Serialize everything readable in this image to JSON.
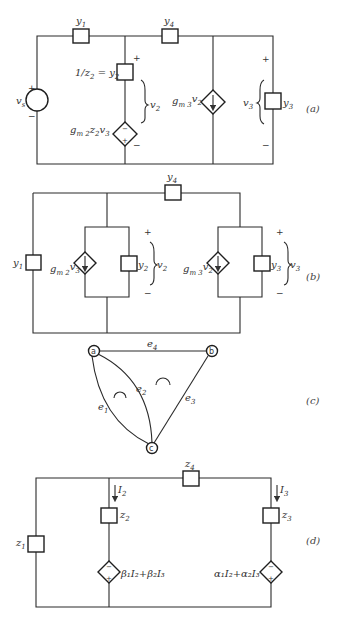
{
  "figure": {
    "panels": [
      {
        "id": "a",
        "tag": "(a)",
        "elements": {
          "source": {
            "label": "v",
            "sub": "s",
            "plus": "+",
            "minus": "−"
          },
          "y1": {
            "label": "y",
            "sub": "1"
          },
          "y4": {
            "label": "y",
            "sub": "4"
          },
          "y2": {
            "label": "1/z",
            "sub": "2",
            "suffix": " = y",
            "suffix_sub": "2",
            "plus": "+"
          },
          "dep2": {
            "label": "g",
            "sub": "m 2",
            "rest": "z",
            "rest_sub": "2",
            "tail": "v",
            "tail_sub": "3",
            "minus": "−"
          },
          "v2": {
            "label": "v",
            "sub": "2"
          },
          "dep3": {
            "label": "g",
            "sub": "m 3",
            "tail": "v",
            "tail_sub": "2"
          },
          "y3": {
            "label": "y",
            "sub": "3",
            "v": "v",
            "v_sub": "3",
            "plus": "+",
            "minus": "−"
          }
        }
      },
      {
        "id": "b",
        "tag": "(b)",
        "elements": {
          "y1": {
            "label": "y",
            "sub": "1"
          },
          "y4": {
            "label": "y",
            "sub": "4"
          },
          "dep2": {
            "label": "g",
            "sub": "m 2",
            "tail": "v",
            "tail_sub": "3"
          },
          "y2": {
            "label": "y",
            "sub": "2",
            "v": "v",
            "v_sub": "2",
            "plus": "+",
            "minus": "−"
          },
          "dep3": {
            "label": "g",
            "sub": "m 3",
            "tail": "v",
            "tail_sub": "2"
          },
          "y3": {
            "label": "y",
            "sub": "3",
            "v": "v",
            "v_sub": "3",
            "plus": "+",
            "minus": "−"
          }
        }
      },
      {
        "id": "c",
        "tag": "(c)",
        "nodes": [
          "a",
          "b",
          "c"
        ],
        "edges": [
          {
            "label": "e",
            "sub": "1"
          },
          {
            "label": "e",
            "sub": "2"
          },
          {
            "label": "e",
            "sub": "3"
          },
          {
            "label": "e",
            "sub": "4"
          }
        ]
      },
      {
        "id": "d",
        "tag": "(d)",
        "elements": {
          "z1": {
            "label": "z",
            "sub": "1"
          },
          "z2": {
            "label": "z",
            "sub": "2"
          },
          "z3": {
            "label": "z",
            "sub": "3"
          },
          "z4": {
            "label": "z",
            "sub": "4"
          },
          "I2": {
            "label": "I",
            "sub": "2"
          },
          "I3": {
            "label": "I",
            "sub": "3"
          },
          "dep2": {
            "text": "β₁I₂+β₂I₃",
            "minus": "−",
            "plus": "+"
          },
          "dep3": {
            "text": "α₁I₂+α₂I₃",
            "minus": "−",
            "plus": "+"
          }
        }
      }
    ]
  }
}
